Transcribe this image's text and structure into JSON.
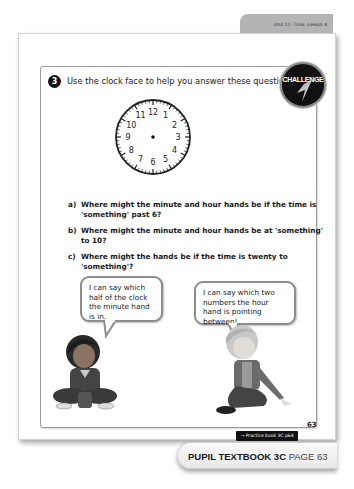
{
  "header": {
    "unit_label": "Unit 11: Time, Lesson 4",
    "badge_label": "CHALLENGE"
  },
  "question": {
    "number": "3",
    "prompt": "Use the clock face to help you answer these questions.",
    "clock_numbers": [
      "12",
      "1",
      "2",
      "3",
      "4",
      "5",
      "6",
      "7",
      "8",
      "9",
      "10",
      "11"
    ],
    "items": [
      {
        "label": "a)",
        "text": "Where might the minute and hour hands be if the time is 'something' past 6?"
      },
      {
        "label": "b)",
        "text": "Where might the minute and hour hands be at 'something' to 10?"
      },
      {
        "label": "c)",
        "text": "Where might the hands be if the time is twenty to 'something'?"
      }
    ]
  },
  "speech": {
    "left": "I can say which half of the clock the minute hand is in.",
    "right": "I can say which two numbers the hour hand is pointing between!"
  },
  "footer": {
    "page_number": "63",
    "practice_ref": "→ Practice book 3C p64",
    "book_title": "PUPIL TEXTBOOK 3C",
    "page_label": "PAGE 63"
  }
}
